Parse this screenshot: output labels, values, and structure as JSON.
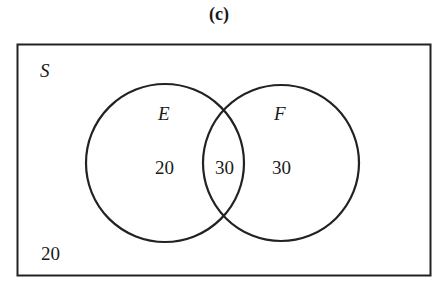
{
  "title": "(c)",
  "universe_label": "S",
  "sets": [
    {
      "name": "E",
      "only_value": "20"
    },
    {
      "name": "F",
      "only_value": "30"
    }
  ],
  "intersection_value": "30",
  "outside_value": "20"
}
